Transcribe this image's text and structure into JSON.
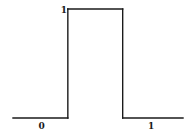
{
  "chart_data": {
    "type": "line",
    "title": "",
    "xlabel": "",
    "ylabel": "",
    "series": [
      {
        "name": "pulse",
        "color": "#1a1a1a",
        "points": [
          {
            "x": -1.0,
            "y": 0
          },
          {
            "x": 0.0,
            "y": 0
          },
          {
            "x": 0.0,
            "y": 1
          },
          {
            "x": 1.0,
            "y": 1
          },
          {
            "x": 1.0,
            "y": 0
          },
          {
            "x": 2.1,
            "y": 0
          }
        ]
      }
    ],
    "xlim": [
      -1.0,
      2.1
    ],
    "ylim": [
      0,
      1
    ],
    "grid": false,
    "legend": "none",
    "annotations": [
      {
        "text": "1",
        "role": "high-level-label",
        "x": 0.0,
        "y": 1
      },
      {
        "text": "0",
        "role": "left-segment-label",
        "x": -0.5,
        "y": 0
      },
      {
        "text": "1",
        "role": "right-segment-label",
        "x": 1.5,
        "y": 0
      }
    ]
  }
}
